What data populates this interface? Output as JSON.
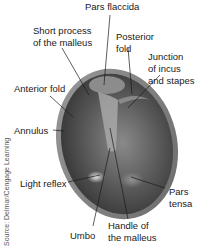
{
  "diagram": {
    "labels": {
      "pars_flaccida": "Pars flaccida",
      "short_process_1": "Short process",
      "short_process_2": "of the malleus",
      "posterior_fold_1": "Posterior",
      "posterior_fold_2": "fold",
      "junction_1": "Junction",
      "junction_2": "of incus",
      "junction_3": "and stapes",
      "anterior_fold": "Anterior fold",
      "annulus": "Annulus",
      "light_reflex": "Light reflex",
      "pars_tensa_1": "Pars",
      "pars_tensa_2": "tensa",
      "umbo": "Umbo",
      "handle_1": "Handle of",
      "handle_2": "the malleus"
    },
    "source": "Source: Delmar/Cengage Learning",
    "colors": {
      "membrane_dark": "#3a3a3a",
      "membrane_mid": "#6e6e6e",
      "membrane_light": "#b8b8b8",
      "leader_line": "#1a1a1a"
    }
  }
}
